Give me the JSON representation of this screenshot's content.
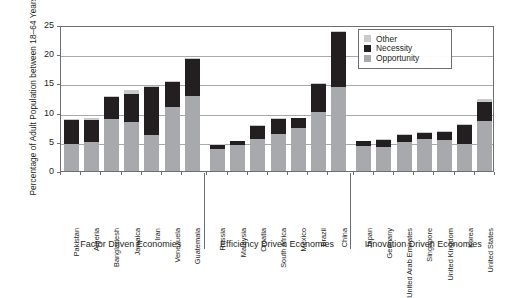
{
  "chart_data": {
    "type": "bar",
    "title": "",
    "xlabel": "",
    "ylabel": "Percentage of Adult Population between 18–64 Years",
    "ylim": [
      0,
      25
    ],
    "yticks": [
      0,
      5,
      10,
      15,
      20,
      25
    ],
    "grid": true,
    "stacked": true,
    "legend_position": "top-right",
    "legend": [
      "Other",
      "Necessity",
      "Opportunity"
    ],
    "colors": {
      "Other": "#c9cacc",
      "Necessity": "#231f20",
      "Opportunity": "#a8a9ad",
      "axis": "#6d6e71",
      "gridline": "#a7a9ac",
      "text": "#231f20"
    },
    "categories": [
      "Pakistan",
      "Algeria",
      "Bangladesh",
      "Jamaica",
      "Iran",
      "Venezuela",
      "Guatemala",
      "Russia",
      "Malaysia",
      "Croatia",
      "South Africa",
      "Mexico",
      "Brazil",
      "China",
      "Japan",
      "Germany",
      "United Arab Emirates",
      "Singapore",
      "United Kingdom",
      "Korea",
      "United States"
    ],
    "series": [
      {
        "name": "Opportunity",
        "values": [
          4.6,
          5.0,
          8.9,
          8.4,
          6.2,
          10.9,
          12.8,
          3.7,
          4.5,
          5.5,
          6.3,
          7.4,
          10.1,
          14.4,
          4.2,
          4.1,
          5.0,
          5.4,
          5.3,
          4.6,
          8.5
        ]
      },
      {
        "name": "Necessity",
        "values": [
          4.1,
          3.8,
          3.7,
          4.8,
          8.2,
          4.4,
          6.4,
          0.8,
          0.6,
          2.2,
          2.6,
          1.6,
          4.8,
          9.4,
          0.9,
          1.2,
          1.2,
          1.1,
          1.3,
          3.2,
          3.3
        ]
      },
      {
        "name": "Other",
        "values": [
          0.2,
          0.2,
          0.2,
          0.7,
          0.2,
          0.2,
          0.1,
          0.1,
          0.1,
          0.1,
          0.1,
          0.1,
          0.2,
          0.2,
          0.1,
          0.2,
          0.1,
          0.1,
          0.2,
          0.2,
          0.6
        ]
      }
    ],
    "groups": [
      {
        "label": "Factor Driven Economies",
        "start": 0,
        "end": 6
      },
      {
        "label": "Efficiency Driven Economies",
        "start": 7,
        "end": 13
      },
      {
        "label": "Innovation Driven Economies",
        "start": 14,
        "end": 20
      }
    ]
  }
}
